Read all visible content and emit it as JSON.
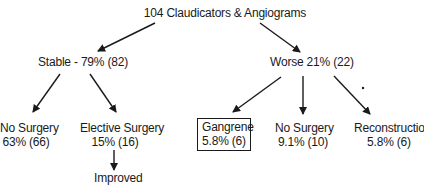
{
  "diagram": {
    "root": {
      "label": "104 Claudicators & Angiograms"
    },
    "stable": {
      "label": "Stable - 79% (82)"
    },
    "worse": {
      "label": "Worse 21% (22)"
    },
    "stable_no_surgery": {
      "line1": "No Surgery",
      "line2": "63% (66)"
    },
    "elective_surgery": {
      "line1": "Elective Surgery",
      "line2": "15% (16)"
    },
    "improved": {
      "label": "Improved"
    },
    "gangrene": {
      "line1": "Gangrene",
      "line2": "5.8% (6)"
    },
    "worse_no_surgery": {
      "line1": "No Surgery",
      "line2": "9.1% (10)"
    },
    "reconstruction": {
      "line1": "Reconstruction",
      "line2": "5.8% (6)"
    },
    "colors": {
      "ink": "#1a1a1a",
      "background": "#ffffff"
    }
  }
}
